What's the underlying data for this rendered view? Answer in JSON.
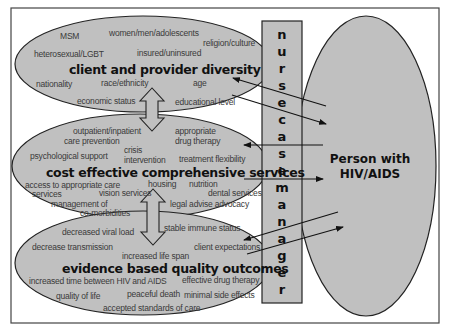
{
  "diagram": {
    "fill_color": "#c0c0c0",
    "stroke_color": "#222222",
    "background": "#ffffff",
    "client_provider": {
      "title": "client and provider diversity",
      "labels": [
        "MSM",
        "women/men/adolescents",
        "religion/culture",
        "heterosexual/LGBT",
        "insured/uninsured",
        "nationality",
        "race/ethnicity",
        "age",
        "economic status",
        "educational level"
      ]
    },
    "services": {
      "title": "cost effective comprehensive services",
      "labels": [
        "outpatient/inpatient",
        "care prevention",
        "appropriate",
        "drug therapy",
        "crisis",
        "intervention",
        "psychological support",
        "treatment flexibility",
        "access to appropriate care",
        "services",
        "housing",
        "nutrition",
        "vision services",
        "dental services",
        "management of",
        "co-morbidities",
        "legal advise advocacy"
      ]
    },
    "outcomes": {
      "title": "evidence based quality outcomes",
      "labels": [
        "decreased viral load",
        "stable immune status",
        "decrease transmission",
        "client expectations",
        "increased life span",
        "increased time between HIV and AIDS",
        "effective drug therapy",
        "quality of life",
        "peaceful death",
        "minimal side effects",
        "accepted standards of care"
      ]
    },
    "nurse_case_manager": {
      "text": "nurse case manager",
      "letters": [
        "n",
        "u",
        "r",
        "s",
        "e",
        "c",
        "a",
        "s",
        "e",
        "m",
        "a",
        "n",
        "a",
        "g",
        "e",
        "r"
      ]
    },
    "person": {
      "line1": "Person with",
      "line2": "HIV/AIDS"
    }
  }
}
